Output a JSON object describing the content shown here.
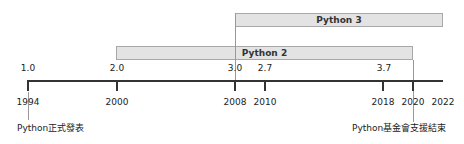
{
  "diagram": {
    "type": "timeline",
    "bars": [
      {
        "label": "Python 3",
        "start_year": 2008,
        "end_year": 2022
      },
      {
        "label": "Python 2",
        "start_year": 2000,
        "end_year": 2020
      }
    ],
    "years": [
      "1994",
      "2000",
      "2008",
      "2010",
      "2018",
      "2020",
      "2022"
    ],
    "versions": [
      {
        "label": "1.0",
        "year": 1994
      },
      {
        "label": "2.0",
        "year": 2000
      },
      {
        "label": "3.0",
        "year": 2008
      },
      {
        "label": "2.7",
        "year": 2010
      },
      {
        "label": "3.7",
        "year": 2018
      }
    ],
    "annotations": [
      {
        "text": "Python正式發表",
        "year": 1994
      },
      {
        "text": "Python基金會支援結束",
        "year": 2020
      }
    ]
  }
}
